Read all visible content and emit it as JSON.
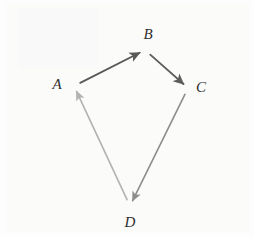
{
  "figure": {
    "kind": "directed-cycle-diagram",
    "background_color": "#fdfdfd",
    "width": 254,
    "height": 237,
    "label_color": "#2f2f2f"
  },
  "nodes": [
    {
      "id": "A",
      "label": "A",
      "x": 74,
      "y": 86,
      "label_x": 57,
      "label_y": 84
    },
    {
      "id": "B",
      "label": "B",
      "x": 145,
      "y": 50,
      "label_x": 148,
      "label_y": 34
    },
    {
      "id": "C",
      "label": "C",
      "x": 188,
      "y": 88,
      "label_x": 201,
      "label_y": 87
    },
    {
      "id": "D",
      "label": "D",
      "x": 130,
      "y": 206,
      "label_x": 130,
      "label_y": 222
    }
  ],
  "edges": [
    {
      "id": "A-B",
      "from": "A",
      "to": "B",
      "color": "#585858",
      "width": 1.8,
      "head": "filled-triangle"
    },
    {
      "id": "B-C",
      "from": "B",
      "to": "C",
      "color": "#5d5d5d",
      "width": 1.8,
      "head": "filled-triangle"
    },
    {
      "id": "C-D",
      "from": "C",
      "to": "D",
      "color": "#8d8d8d",
      "width": 1.6,
      "head": "filled-triangle"
    },
    {
      "id": "D-A",
      "from": "D",
      "to": "A",
      "color": "#b2b2b2",
      "width": 1.6,
      "head": "filled-triangle"
    }
  ]
}
